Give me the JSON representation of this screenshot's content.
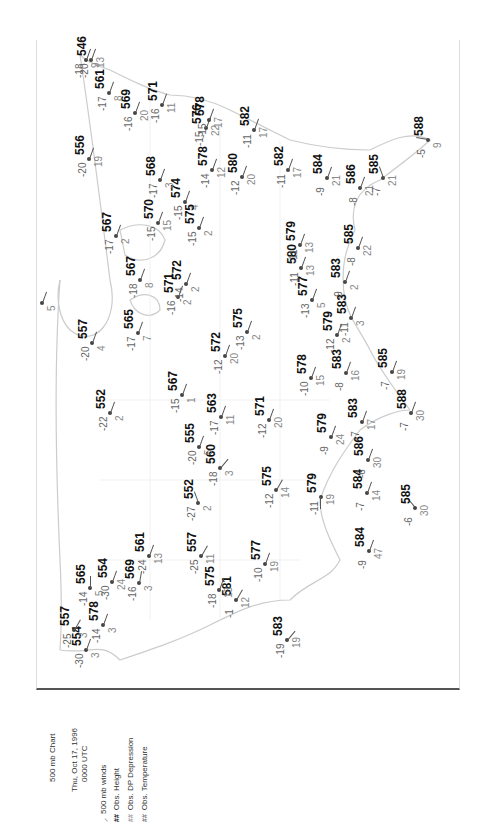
{
  "legend": {
    "title": "500 mb Chart",
    "date": "Thu, Oct 17, 1996",
    "time": "0000 UTC",
    "items": [
      {
        "symbol": "wind-barb-icon",
        "glyph": "⸝",
        "label": "500 mb winds",
        "color": "#333333"
      },
      {
        "symbol": "##",
        "label": "Obs. Height",
        "color": "#111111"
      },
      {
        "symbol": "##",
        "label": "Obs. DP Depression",
        "color": "#999999"
      },
      {
        "symbol": "##",
        "label": "Obs. Temperature",
        "color": "#777777"
      }
    ]
  },
  "stations": [
    {
      "x": 86,
      "y": 650,
      "h": "554",
      "t": "-30",
      "d": "3",
      "wd": 200
    },
    {
      "x": 74,
      "y": 630,
      "h": "557",
      "t": "-25",
      "d": "3",
      "wd": 210
    },
    {
      "x": 90,
      "y": 588,
      "h": "565",
      "t": "-14",
      "d": "5",
      "wd": 180
    },
    {
      "x": 103,
      "y": 625,
      "h": "578",
      "t": "-14",
      "d": "3",
      "wd": 200
    },
    {
      "x": 139,
      "y": 583,
      "h": "569",
      "t": "-16",
      "d": "3",
      "wd": 190
    },
    {
      "x": 112,
      "y": 582,
      "h": "554",
      "t": "-30",
      "d": "24",
      "wd": 200
    },
    {
      "x": 149,
      "y": 556,
      "h": "561",
      "t": "-24",
      "d": "13",
      "wd": 200
    },
    {
      "x": 236,
      "y": 600,
      "h": "581",
      "t": "-1",
      "d": "12",
      "wd": 210
    },
    {
      "x": 219,
      "y": 590,
      "h": "575",
      "t": "-18",
      "d": "13",
      "wd": 200
    },
    {
      "x": 287,
      "y": 640,
      "h": "583",
      "t": "-19",
      "d": "19",
      "wd": 220
    },
    {
      "x": 201,
      "y": 556,
      "h": "557",
      "t": "-25",
      "d": "11",
      "wd": 210
    },
    {
      "x": 198,
      "y": 503,
      "h": "552",
      "t": "-27",
      "d": "2",
      "wd": 160
    },
    {
      "x": 220,
      "y": 468,
      "h": "560",
      "t": "-18",
      "d": "3",
      "wd": 220
    },
    {
      "x": 276,
      "y": 490,
      "h": "575",
      "t": "-12",
      "d": "14",
      "wd": 210
    },
    {
      "x": 265,
      "y": 564,
      "h": "577",
      "t": "-10",
      "d": "19",
      "wd": 200
    },
    {
      "x": 321,
      "y": 497,
      "h": "579",
      "t": "-11",
      "d": "19",
      "wd": 0
    },
    {
      "x": 367,
      "y": 493,
      "h": "584",
      "t": "-7",
      "d": "14",
      "wd": 200
    },
    {
      "x": 369,
      "y": 551,
      "h": "584",
      "t": "-9",
      "d": "47",
      "wd": 200
    },
    {
      "x": 415,
      "y": 508,
      "h": "585",
      "t": "-6",
      "d": "30",
      "wd": 140
    },
    {
      "x": 368,
      "y": 460,
      "h": "586",
      "t": "-6",
      "d": "30",
      "wd": 200
    },
    {
      "x": 362,
      "y": 422,
      "h": "583",
      "t": "-7",
      "d": "17",
      "wd": 200
    },
    {
      "x": 411,
      "y": 413,
      "h": "588",
      "t": "-7",
      "d": "30",
      "wd": 200
    },
    {
      "x": 331,
      "y": 437,
      "h": "579",
      "t": "-9",
      "d": "24",
      "wd": 200
    },
    {
      "x": 269,
      "y": 420,
      "h": "571",
      "t": "-12",
      "d": "20",
      "wd": 200
    },
    {
      "x": 221,
      "y": 417,
      "h": "563",
      "t": "-17",
      "d": "11",
      "wd": 200
    },
    {
      "x": 199,
      "y": 447,
      "h": "555",
      "t": "-20",
      "d": "5",
      "wd": 200
    },
    {
      "x": 110,
      "y": 413,
      "h": "552",
      "t": "-22",
      "d": "2",
      "wd": 200
    },
    {
      "x": 182,
      "y": 395,
      "h": "567",
      "t": "-15",
      "d": "1",
      "wd": 200
    },
    {
      "x": 225,
      "y": 356,
      "h": "572",
      "t": "-12",
      "d": "20",
      "wd": 200
    },
    {
      "x": 247,
      "y": 332,
      "h": "575",
      "t": "-13",
      "d": "2",
      "wd": 200
    },
    {
      "x": 311,
      "y": 378,
      "h": "578",
      "t": "-10",
      "d": "15",
      "wd": 200
    },
    {
      "x": 337,
      "y": 335,
      "h": "579",
      "t": "-12",
      "d": "2",
      "wd": 200
    },
    {
      "x": 346,
      "y": 373,
      "h": "583",
      "t": "-8",
      "d": "16",
      "wd": 200
    },
    {
      "x": 392,
      "y": 372,
      "h": "585",
      "t": "-7",
      "d": "19",
      "wd": 200
    },
    {
      "x": 312,
      "y": 300,
      "h": "577",
      "t": "-13",
      "d": "5",
      "wd": 200
    },
    {
      "x": 351,
      "y": 318,
      "h": "583",
      "t": "-11",
      "d": "3",
      "wd": 200
    },
    {
      "x": 345,
      "y": 282,
      "h": "583",
      "t": "-9",
      "d": "2",
      "wd": 200
    },
    {
      "x": 301,
      "y": 268,
      "h": "580",
      "t": "-11",
      "d": "13",
      "wd": 200
    },
    {
      "x": 300,
      "y": 245,
      "h": "579",
      "t": "-11",
      "d": "13",
      "wd": 200
    },
    {
      "x": 358,
      "y": 248,
      "h": "585",
      "t": "-8",
      "d": "22",
      "wd": 200
    },
    {
      "x": 360,
      "y": 188,
      "h": "586",
      "t": "-8",
      "d": "21",
      "wd": 200
    },
    {
      "x": 327,
      "y": 178,
      "h": "584",
      "t": "-9",
      "d": "21",
      "wd": 200
    },
    {
      "x": 383,
      "y": 178,
      "h": "585",
      "t": "-7",
      "d": "21",
      "wd": 160
    },
    {
      "x": 428,
      "y": 140,
      "h": "588",
      "t": "-5",
      "d": "9",
      "wd": 100
    },
    {
      "x": 288,
      "y": 170,
      "h": "582",
      "t": "-11",
      "d": "17",
      "wd": 200
    },
    {
      "x": 254,
      "y": 130,
      "h": "582",
      "t": "-11",
      "d": "17",
      "wd": 200
    },
    {
      "x": 212,
      "y": 170,
      "h": "578",
      "t": "-14",
      "d": "12",
      "wd": 200
    },
    {
      "x": 242,
      "y": 177,
      "h": "580",
      "t": "-12",
      "d": "20",
      "wd": 200
    },
    {
      "x": 206,
      "y": 128,
      "h": "576",
      "t": "-15",
      "d": "22",
      "wd": 200
    },
    {
      "x": 209,
      "y": 120,
      "h": "578",
      "t": "-15",
      "d": "17",
      "wd": 200
    },
    {
      "x": 185,
      "y": 202,
      "h": "574",
      "t": "-15",
      "d": "4",
      "wd": 200
    },
    {
      "x": 160,
      "y": 180,
      "h": "568",
      "t": "-17",
      "d": "3",
      "wd": 200
    },
    {
      "x": 158,
      "y": 223,
      "h": "570",
      "t": "-15",
      "d": "15",
      "wd": 200
    },
    {
      "x": 199,
      "y": 228,
      "h": "575",
      "t": "-15",
      "d": "2",
      "wd": 200
    },
    {
      "x": 162,
      "y": 105,
      "h": "571",
      "t": "-16",
      "d": "11",
      "wd": 200
    },
    {
      "x": 135,
      "y": 113,
      "h": "569",
      "t": "-16",
      "d": "20",
      "wd": 200
    },
    {
      "x": 109,
      "y": 93,
      "h": "561",
      "t": "-17",
      "d": "8",
      "wd": 200
    },
    {
      "x": 91,
      "y": 60,
      "h": "546",
      "t": "-20",
      "d": "13",
      "wd": 200
    },
    {
      "x": 89,
      "y": 159,
      "h": "556",
      "t": "-20",
      "d": "19",
      "wd": 200
    },
    {
      "x": 116,
      "y": 236,
      "h": "567",
      "t": "-17",
      "d": "2",
      "wd": 200
    },
    {
      "x": 140,
      "y": 280,
      "h": "567",
      "t": "-18",
      "d": "8",
      "wd": 200
    },
    {
      "x": 178,
      "y": 297,
      "h": "571",
      "t": "-16",
      "d": "2",
      "wd": 200
    },
    {
      "x": 186,
      "y": 284,
      "h": "572",
      "t": "-14",
      "d": "2",
      "wd": 200
    },
    {
      "x": 138,
      "y": 333,
      "h": "565",
      "t": "-17",
      "d": "7",
      "wd": 200
    },
    {
      "x": 92,
      "y": 343,
      "h": "557",
      "t": "-20",
      "d": "4",
      "wd": 200
    },
    {
      "x": 42,
      "y": 303,
      "h": "",
      "t": "",
      "d": "5",
      "wd": 200
    },
    {
      "x": 86,
      "y": 60,
      "h": "",
      "t": "-18",
      "d": "9",
      "wd": 200
    }
  ]
}
